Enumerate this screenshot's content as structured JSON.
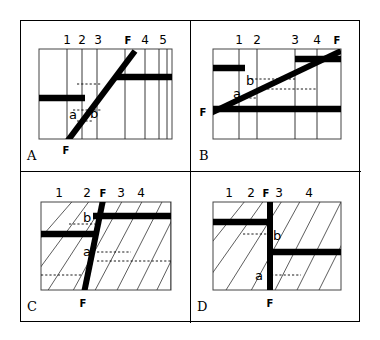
{
  "figure": {
    "caption_letters": [
      "A",
      "B",
      "C",
      "D"
    ],
    "fault_label": "F",
    "offset_labels": {
      "a": "a",
      "b": "b"
    },
    "colors": {
      "ink": "#000000",
      "bed": "#000000",
      "fault": "#000000",
      "grid": "#222222",
      "background": "#ffffff"
    }
  },
  "panels": [
    {
      "id": "A",
      "letter": "A",
      "column_numbers": [
        "1",
        "2",
        "3",
        "4",
        "5"
      ],
      "fault_labels": {
        "top": "F",
        "bottom": "F"
      },
      "offset_labels": [
        "a",
        "b"
      ],
      "fault_style": "inclined-steep-right",
      "bed_style": "offset-horizontal-marker-bed",
      "hatching": "none"
    },
    {
      "id": "B",
      "letter": "B",
      "column_numbers": [
        "1",
        "2",
        "3",
        "4"
      ],
      "fault_labels": {
        "top": "F",
        "bottom": "F"
      },
      "offset_labels": [
        "a",
        "b"
      ],
      "fault_style": "inclined-shallow-right",
      "bed_style": "offset-horizontal-marker-bed",
      "hatching": "none"
    },
    {
      "id": "C",
      "letter": "C",
      "column_numbers": [
        "1",
        "2",
        "3",
        "4"
      ],
      "fault_labels": {
        "top": "F",
        "bottom": "F"
      },
      "offset_labels": [
        "a",
        "b"
      ],
      "fault_style": "steep-left-dipping",
      "bed_style": "offset-horizontal-marker-bed",
      "hatching": "diagonal"
    },
    {
      "id": "D",
      "letter": "D",
      "column_numbers": [
        "1",
        "2",
        "3",
        "4"
      ],
      "fault_labels": {
        "top": "F",
        "bottom": "F"
      },
      "offset_labels": [
        "a",
        "b"
      ],
      "fault_style": "vertical",
      "bed_style": "offset-horizontal-marker-bed",
      "hatching": "diagonal"
    }
  ]
}
